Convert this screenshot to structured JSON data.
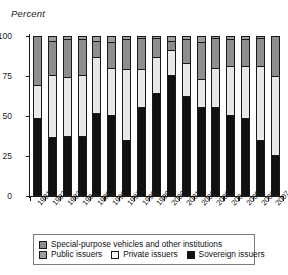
{
  "chart_data": {
    "type": "bar",
    "stacked": true,
    "title": "",
    "xlabel": "",
    "ylabel": "Percent",
    "ylim": [
      0,
      100
    ],
    "yticks": [
      0,
      25,
      50,
      75,
      100
    ],
    "ytick_labels": [
      "0",
      "25",
      "50",
      "75",
      "100"
    ],
    "grid": false,
    "legend_position": "bottom",
    "categories": [
      "1991",
      "1992",
      "1993",
      "1994",
      "1995",
      "1996",
      "1997",
      "1998",
      "1999",
      "2000",
      "2001",
      "2002",
      "2003",
      "2004",
      "2005",
      "2006",
      "2007"
    ],
    "series": [
      {
        "name": "Sovereign issuers",
        "color": "#111111",
        "values": [
          48,
          36,
          37,
          37,
          51,
          50,
          34,
          55,
          64,
          75,
          62,
          55,
          55,
          50,
          48,
          34,
          25
        ]
      },
      {
        "name": "Private issuers",
        "color": "#e8e8e8",
        "values": [
          21,
          39,
          37,
          38,
          36,
          30,
          45,
          24,
          23,
          16,
          21,
          18,
          25,
          31,
          33,
          47,
          50
        ]
      },
      {
        "name": "Special-purpose vehicles and other institutions",
        "color": "#8e8e8e",
        "values": [
          31,
          22,
          24,
          23,
          10,
          16,
          19,
          20,
          12,
          6,
          15,
          23,
          19,
          17,
          17,
          18,
          25
        ]
      },
      {
        "name": "Public issuers",
        "color": "#9e9e9e",
        "values": [
          0,
          3,
          2,
          2,
          3,
          4,
          2,
          1,
          1,
          3,
          2,
          4,
          1,
          2,
          2,
          1,
          0
        ]
      }
    ],
    "legend": [
      "Special-purpose vehicles and other institutions",
      "Public issuers",
      "Private issuers",
      "Sovereign issuers"
    ]
  }
}
